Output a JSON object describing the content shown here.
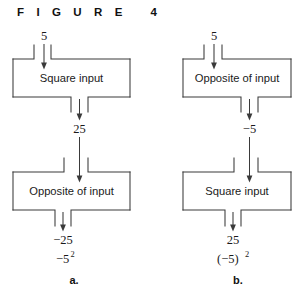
{
  "figure": {
    "title": "F I G U R E   4",
    "panels": [
      {
        "id": "a",
        "letter": "a.",
        "input_value": "5",
        "steps": [
          {
            "box_label": "Square input",
            "output_value": "25"
          },
          {
            "box_label": "Opposite of input",
            "output_value": "−25"
          }
        ],
        "expression_base": "−5",
        "expression_exponent": "2",
        "expression_full": "−5²"
      },
      {
        "id": "b",
        "letter": "b.",
        "input_value": "5",
        "steps": [
          {
            "box_label": "Opposite of input",
            "output_value": "−5"
          },
          {
            "box_label": "Square input",
            "output_value": "25"
          }
        ],
        "expression_base": "(−5)",
        "expression_exponent": "2",
        "expression_full": "(−5)²"
      }
    ]
  },
  "colors": {
    "ink": "#1a1a1a",
    "line": "#3a3a3a",
    "background": "#ffffff"
  }
}
